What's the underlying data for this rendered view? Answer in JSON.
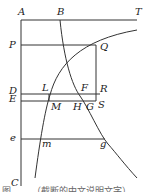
{
  "figure": {
    "labels": {
      "A": "A",
      "B": "B",
      "T": "T",
      "P": "P",
      "Q": "Q",
      "D": "D",
      "L": "L",
      "F": "F",
      "R": "R",
      "E": "E",
      "M": "M",
      "H": "H",
      "G": "G",
      "S": "S",
      "e": "e",
      "m": "m",
      "g": "g",
      "C": "C"
    },
    "caption": "图 ……（截断的中文说明文字）"
  }
}
